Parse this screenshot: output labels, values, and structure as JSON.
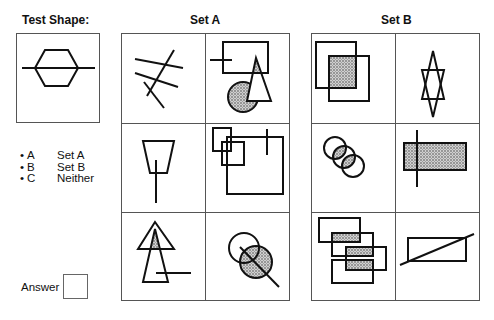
{
  "test_shape": {
    "title": "Test Shape:",
    "shape": "hexagon-with-horizontal-line"
  },
  "legend": {
    "items": [
      {
        "key": "A",
        "label": "Set A"
      },
      {
        "key": "B",
        "label": "Set B"
      },
      {
        "key": "C",
        "label": "Neither"
      }
    ]
  },
  "answer": {
    "label": "Answer",
    "value": ""
  },
  "set_a": {
    "title": "Set A",
    "cells": [
      {
        "row": 1,
        "col": 1,
        "shape": "four-crossing-lines"
      },
      {
        "row": 1,
        "col": 2,
        "shape": "rectangle-line-triangle-shaded-circle"
      },
      {
        "row": 2,
        "col": 1,
        "shape": "trapezoid-with-vertical-line"
      },
      {
        "row": 2,
        "col": 2,
        "shape": "overlapping-squares-with-line"
      },
      {
        "row": 3,
        "col": 1,
        "shape": "overlapping-triangles-with-line"
      },
      {
        "row": 3,
        "col": 2,
        "shape": "two-circles-with-diagonal-line"
      }
    ]
  },
  "set_b": {
    "title": "Set B",
    "cells": [
      {
        "row": 1,
        "col": 1,
        "shape": "overlapping-squares-shaded"
      },
      {
        "row": 1,
        "col": 2,
        "shape": "star-of-david"
      },
      {
        "row": 2,
        "col": 1,
        "shape": "three-circles-shaded-overlap"
      },
      {
        "row": 2,
        "col": 2,
        "shape": "shaded-rectangle-with-vertical-line"
      },
      {
        "row": 3,
        "col": 1,
        "shape": "four-rectangles-shaded-overlaps"
      },
      {
        "row": 3,
        "col": 2,
        "shape": "rectangle-with-diagonal-line"
      }
    ]
  },
  "colors": {
    "stroke": "#111111",
    "grid": "#555555",
    "shade": "#9a9a9a"
  }
}
